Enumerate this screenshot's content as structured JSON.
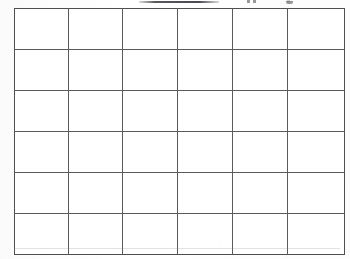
{
  "document": {
    "kind": "scanned-worksheet",
    "description": "Blank six-by-six grid table on white paper",
    "background_color": "#fdfdfd",
    "line_color": "#5a5a5a",
    "frame_color": "#4f4f4f"
  },
  "heading": {
    "visible": false,
    "note": "clipped at top edge of crop; only an underline rule and letter descenders remain, text illegible",
    "text": ""
  },
  "grid": {
    "rows": 6,
    "columns": 6,
    "cell_count": 36,
    "all_cells_empty": true,
    "left": 14,
    "top": 8,
    "width": 324,
    "height": 240,
    "row_height": 40,
    "column_widths": [
      53,
      53,
      54,
      54,
      54,
      56
    ],
    "cells": [
      [
        "",
        "",
        "",
        "",
        "",
        ""
      ],
      [
        "",
        "",
        "",
        "",
        "",
        ""
      ],
      [
        "",
        "",
        "",
        "",
        "",
        ""
      ],
      [
        "",
        "",
        "",
        "",
        "",
        ""
      ],
      [
        "",
        "",
        "",
        "",
        "",
        ""
      ],
      [
        "",
        "",
        "",
        "",
        "",
        ""
      ]
    ]
  }
}
